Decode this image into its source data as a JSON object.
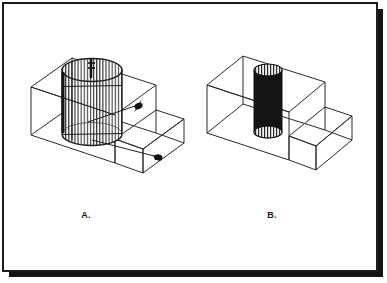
{
  "page": {
    "background_color": "#ffffff",
    "border_color": "#1c1c1c",
    "shadow_color": "#141414",
    "line_color": "#262626",
    "fill_color": "#ffffff",
    "cylinder_solid_color": "#141414",
    "cylinder_hatch_color": "#333333",
    "arrow_color": "#111111"
  },
  "figures": [
    {
      "id": "figure-a",
      "label": "A.",
      "description": "isometric step block with vertically hatched transparent cylinder and two callout arrows",
      "cylinder_style": "hatched",
      "arrow_count": 2
    },
    {
      "id": "figure-b",
      "label": "B.",
      "description": "isometric step block with solid filled cylinder and striped end caps",
      "cylinder_style": "solid",
      "arrow_count": 0
    }
  ],
  "labels": {
    "figure_a": "A.",
    "figure_b": "B."
  }
}
